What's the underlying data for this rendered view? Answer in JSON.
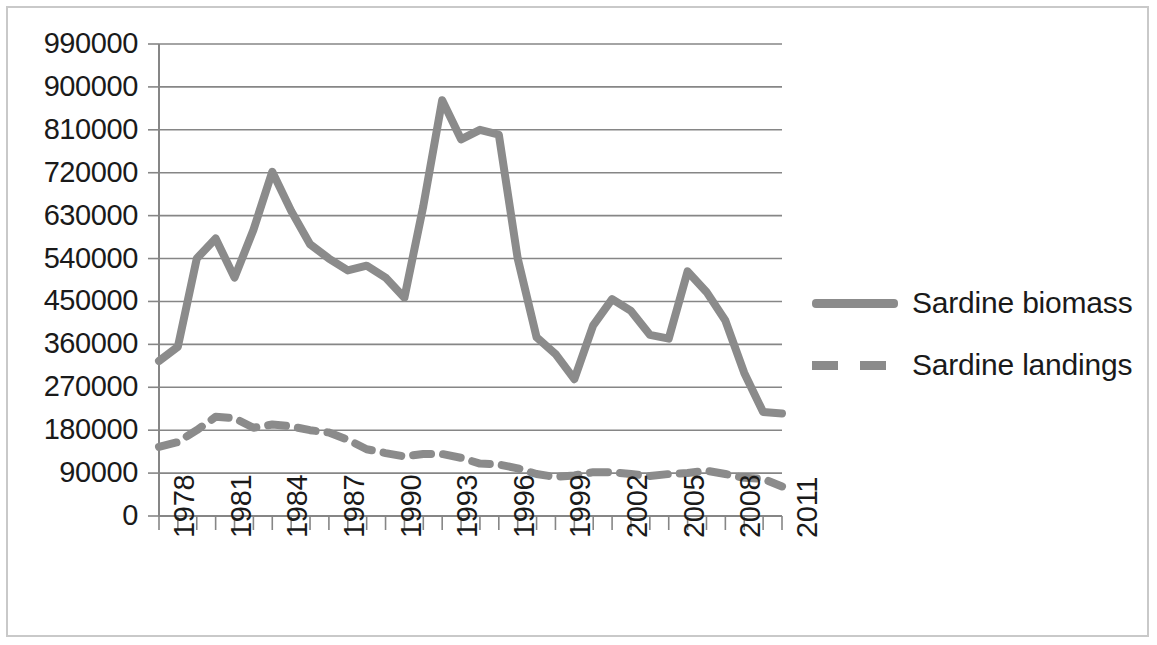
{
  "chart_data": {
    "type": "line",
    "title": "",
    "xlabel": "",
    "ylabel": "",
    "xlim": [
      1978,
      2011
    ],
    "ylim": [
      0,
      990000
    ],
    "grid": true,
    "legend_position": "right",
    "y_ticks": [
      "990000",
      "900000",
      "810000",
      "720000",
      "630000",
      "540000",
      "450000",
      "360000",
      "270000",
      "180000",
      "90000",
      "0"
    ],
    "y_tick_values": [
      990000,
      900000,
      810000,
      720000,
      630000,
      540000,
      450000,
      360000,
      270000,
      180000,
      90000,
      0
    ],
    "x_ticks": [
      "1978",
      "1981",
      "1984",
      "1987",
      "1990",
      "1993",
      "1996",
      "1999",
      "2002",
      "2005",
      "2008",
      "2011"
    ],
    "x_tick_values": [
      1978,
      1981,
      1984,
      1987,
      1990,
      1993,
      1996,
      1999,
      2002,
      2005,
      2008,
      2011
    ],
    "x": [
      1978,
      1979,
      1980,
      1981,
      1982,
      1983,
      1984,
      1985,
      1986,
      1987,
      1988,
      1989,
      1990,
      1991,
      1992,
      1993,
      1994,
      1995,
      1996,
      1997,
      1998,
      1999,
      2000,
      2001,
      2002,
      2003,
      2004,
      2005,
      2006,
      2007,
      2008,
      2009,
      2010,
      2011
    ],
    "series": [
      {
        "name": "Sardine biomass",
        "style": "solid",
        "color": "#8b8b8b",
        "values": [
          325000,
          355000,
          540000,
          582000,
          500000,
          600000,
          722000,
          640000,
          570000,
          540000,
          515000,
          525000,
          500000,
          458000,
          650000,
          872000,
          790000,
          810000,
          800000,
          540000,
          375000,
          340000,
          287000,
          400000,
          455000,
          430000,
          380000,
          372000,
          513000,
          470000,
          410000,
          300000,
          218000,
          215000
        ]
      },
      {
        "name": "Sardine landings",
        "style": "dashed",
        "color": "#8b8b8b",
        "values": [
          145000,
          155000,
          180000,
          208000,
          205000,
          185000,
          192000,
          188000,
          180000,
          175000,
          160000,
          140000,
          132000,
          125000,
          130000,
          130000,
          122000,
          110000,
          108000,
          100000,
          88000,
          82000,
          85000,
          92000,
          92000,
          88000,
          84000,
          88000,
          90000,
          95000,
          88000,
          80000,
          78000,
          62000
        ]
      }
    ]
  },
  "legend": {
    "items": [
      {
        "label": "Sardine biomass",
        "style": "solid"
      },
      {
        "label": "Sardine landings",
        "style": "dashed"
      }
    ]
  }
}
